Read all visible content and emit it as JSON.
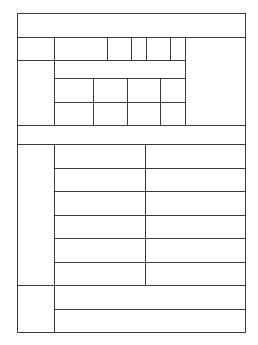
{
  "form": {
    "title": "",
    "line_color": "#3a3a3a",
    "background": "#ffffff",
    "sections": [
      {
        "name": "header-row",
        "cells": [
          ""
        ]
      },
      {
        "name": "top-block",
        "label": "",
        "row1": [
          "",
          "",
          "",
          "",
          ""
        ],
        "row2": [
          ""
        ],
        "row3": [
          "",
          "",
          "",
          ""
        ],
        "row4": [
          "",
          "",
          "",
          ""
        ],
        "side": ""
      },
      {
        "name": "divider-row",
        "cells": [
          ""
        ]
      },
      {
        "name": "middle-block",
        "label": "",
        "rows": [
          [
            "",
            ""
          ],
          [
            "",
            ""
          ],
          [
            "",
            ""
          ],
          [
            "",
            ""
          ],
          [
            "",
            ""
          ],
          [
            "",
            ""
          ]
        ]
      },
      {
        "name": "bottom-block",
        "label": "",
        "rows": [
          [
            ""
          ],
          [
            ""
          ]
        ]
      }
    ]
  }
}
